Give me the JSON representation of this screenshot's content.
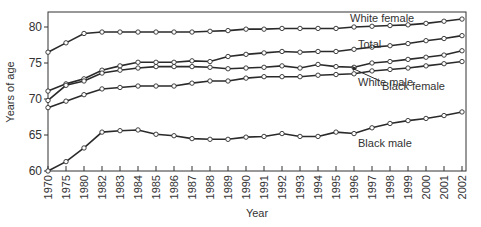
{
  "chart_data": {
    "type": "line",
    "title": "",
    "xlabel": "Year",
    "ylabel": "Years of age",
    "ylim": [
      60,
      82
    ],
    "yticks": [
      60,
      65,
      70,
      75,
      80
    ],
    "grid": false,
    "legend": "inline labels",
    "categories": [
      "1970",
      "1975",
      "1980",
      "1982",
      "1983",
      "1984",
      "1985",
      "1986",
      "1987",
      "1988",
      "1989",
      "1990",
      "1991",
      "1992",
      "1993",
      "1994",
      "1995",
      "1996",
      "1997",
      "1998",
      "1999",
      "2000",
      "2001",
      "2002"
    ],
    "series": [
      {
        "name": "White female",
        "label_pos": [
          350,
          22
        ],
        "values": [
          76.5,
          77.8,
          79.1,
          79.3,
          79.3,
          79.3,
          79.3,
          79.3,
          79.3,
          79.4,
          79.5,
          79.7,
          79.7,
          79.8,
          79.8,
          79.8,
          79.8,
          80.0,
          80.1,
          80.2,
          80.3,
          80.5,
          80.8,
          81.1
        ]
      },
      {
        "name": "Total",
        "label_pos": [
          358,
          48
        ],
        "values": [
          71.1,
          72.1,
          72.8,
          74.0,
          74.6,
          75.1,
          75.1,
          75.1,
          75.3,
          75.2,
          75.9,
          76.2,
          76.4,
          76.6,
          76.5,
          76.6,
          76.6,
          76.9,
          77.2,
          77.4,
          77.7,
          78.1,
          78.4,
          78.8
        ]
      },
      {
        "name": "Black female",
        "label_pos": [
          382,
          90
        ],
        "arrow_to": [
          352,
          66
        ],
        "values": [
          69.8,
          71.9,
          72.5,
          73.6,
          74.0,
          74.3,
          74.5,
          74.5,
          74.5,
          74.4,
          74.2,
          74.3,
          74.4,
          74.6,
          74.3,
          74.8,
          74.5,
          74.4,
          75.0,
          75.2,
          75.5,
          75.8,
          76.1,
          76.7
        ]
      },
      {
        "name": "White male",
        "label_pos": [
          358,
          86
        ],
        "values": [
          68.8,
          69.7,
          70.6,
          71.4,
          71.6,
          71.8,
          71.8,
          71.8,
          72.2,
          72.5,
          72.5,
          72.9,
          73.1,
          73.1,
          73.1,
          73.3,
          73.4,
          73.5,
          73.9,
          74.1,
          74.3,
          74.6,
          74.9,
          75.2
        ]
      },
      {
        "name": "Black male",
        "label_pos": [
          358,
          147
        ],
        "values": [
          60.0,
          61.3,
          63.2,
          65.4,
          65.6,
          65.7,
          65.1,
          64.9,
          64.5,
          64.4,
          64.4,
          64.7,
          64.8,
          65.2,
          64.8,
          64.8,
          65.4,
          65.2,
          66.0,
          66.6,
          67.0,
          67.3,
          67.7,
          68.2
        ]
      }
    ]
  },
  "colors": {
    "line": "#2a2a2a",
    "marker_fill": "#ffffff",
    "axis": "#333333"
  }
}
